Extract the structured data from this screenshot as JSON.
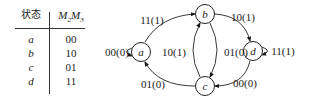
{
  "table": {
    "headers": [
      "状态",
      "M2M3"
    ],
    "header_sub": {
      "m1": "M",
      "s1": "2",
      "m2": "M",
      "s2": "3"
    },
    "rows": [
      {
        "state": "a",
        "code": "00"
      },
      {
        "state": "b",
        "code": "10"
      },
      {
        "state": "c",
        "code": "01"
      },
      {
        "state": "d",
        "code": "11"
      }
    ]
  },
  "diagram": {
    "nodes": [
      {
        "id": "a",
        "label": "a"
      },
      {
        "id": "b",
        "label": "b"
      },
      {
        "id": "c",
        "label": "c"
      },
      {
        "id": "d",
        "label": "d"
      }
    ],
    "edges": [
      {
        "from": "a",
        "to": "a",
        "label": "00(0)"
      },
      {
        "from": "a",
        "to": "b",
        "label": "11(1)"
      },
      {
        "from": "b",
        "to": "d",
        "label": "10(1)"
      },
      {
        "from": "c",
        "to": "b",
        "label": "10(1)"
      },
      {
        "from": "b",
        "to": "c",
        "label": "01(0)"
      },
      {
        "from": "d",
        "to": "d",
        "label": "11(1)"
      },
      {
        "from": "d",
        "to": "c",
        "label": "00(0)"
      },
      {
        "from": "c",
        "to": "a",
        "label": "01(0)"
      }
    ]
  }
}
